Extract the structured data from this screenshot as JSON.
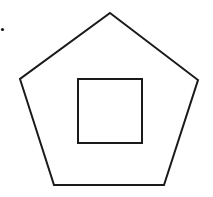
{
  "diagram": {
    "canvas": {
      "width": 213,
      "height": 197,
      "background": "#ffffff"
    },
    "stroke_color": "#1a1a1a",
    "stroke_width": 2,
    "bullet_dot": {
      "cx": 2.5,
      "cy": 29.5,
      "r": 1.6
    },
    "pentagon": {
      "points": "110,13 198,80 164,185 54,185 20,79"
    },
    "square": {
      "x": 78,
      "y": 79,
      "width": 64,
      "height": 64
    }
  }
}
